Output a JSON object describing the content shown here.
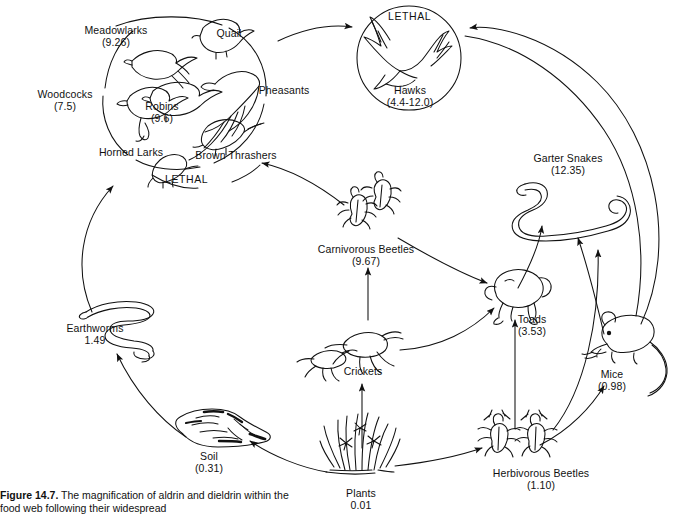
{
  "figure": {
    "number_label": "Figure 14.7.",
    "caption_text": " The magnification of aldrin and dieldrin within the food web following their widespread"
  },
  "diagram": {
    "type": "food-web",
    "lethal_markers": [
      {
        "id": "lethal-hawks",
        "text": "LETHAL"
      },
      {
        "id": "lethal-songbirds",
        "text": "LETHAL"
      }
    ],
    "nodes": [
      {
        "id": "meadowlarks",
        "name": "Meadowlarks",
        "value": "(9.26)"
      },
      {
        "id": "quail",
        "name": "Quail",
        "value": ""
      },
      {
        "id": "woodcocks",
        "name": "Woodcocks",
        "value": "(7.5)"
      },
      {
        "id": "robins",
        "name": "Robins",
        "value": "(9.6)"
      },
      {
        "id": "pheasants",
        "name": "Pheasants",
        "value": ""
      },
      {
        "id": "horned-larks",
        "name": "Horned Larks",
        "value": ""
      },
      {
        "id": "brown-thrashers",
        "name": "Brown Thrashers",
        "value": ""
      },
      {
        "id": "hawks",
        "name": "Hawks",
        "value": "(4.4-12.0)"
      },
      {
        "id": "garter-snakes",
        "name": "Garter Snakes",
        "value": "(12.35)"
      },
      {
        "id": "carnivorous-beetles",
        "name": "Carnivorous Beetles",
        "value": "(9.67)"
      },
      {
        "id": "toads",
        "name": "Toads",
        "value": "(3.53)"
      },
      {
        "id": "mice",
        "name": "Mice",
        "value": "(0.98)"
      },
      {
        "id": "earthworms",
        "name": "Earthworms",
        "value": "1.49"
      },
      {
        "id": "crickets",
        "name": "Crickets",
        "value": ""
      },
      {
        "id": "soil",
        "name": "Soil",
        "value": "(0.31)"
      },
      {
        "id": "plants",
        "name": "Plants",
        "value": "0.01"
      },
      {
        "id": "herbivorous-beetles",
        "name": "Herbivorous Beetles",
        "value": "(1.10)"
      }
    ],
    "edges": [
      {
        "from": "songbird-group",
        "to": "hawks"
      },
      {
        "from": "garter-snakes",
        "to": "hawks"
      },
      {
        "from": "earthworms",
        "to": "horned-larks"
      },
      {
        "from": "carnivorous-beetles",
        "to": "brown-thrashers"
      },
      {
        "from": "carnivorous-beetles",
        "to": "toads"
      },
      {
        "from": "crickets",
        "to": "carnivorous-beetles"
      },
      {
        "from": "crickets",
        "to": "toads"
      },
      {
        "from": "plants",
        "to": "crickets"
      },
      {
        "from": "plants",
        "to": "soil"
      },
      {
        "from": "plants",
        "to": "herbivorous-beetles"
      },
      {
        "from": "soil",
        "to": "earthworms"
      },
      {
        "from": "herbivorous-beetles",
        "to": "toads"
      },
      {
        "from": "herbivorous-beetles",
        "to": "mice"
      },
      {
        "from": "herbivorous-beetles",
        "to": "garter-snakes"
      },
      {
        "from": "toads",
        "to": "garter-snakes"
      },
      {
        "from": "mice",
        "to": "garter-snakes"
      }
    ],
    "colors": {
      "ink": "#111111",
      "background": "#ffffff"
    }
  }
}
